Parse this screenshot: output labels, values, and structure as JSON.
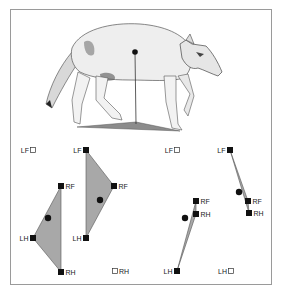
{
  "figure": {
    "illustration": {
      "center_of_mass": {
        "x": 135,
        "y": 52
      },
      "plumb_line_end": {
        "x": 136,
        "y": 124
      },
      "support_polygon": [
        [
          77,
          127
        ],
        [
          136,
          122
        ],
        [
          180,
          131
        ]
      ],
      "fill_color": "#8c8c8c"
    },
    "panels": [
      {
        "id": "panel-1",
        "labels": {
          "LF": "LF",
          "RF": "RF",
          "LH": "LH",
          "RH": "RH"
        },
        "feet": {
          "LF": {
            "x": 33,
            "y": 150,
            "contact": false,
            "label_side": "left"
          },
          "RF": {
            "x": 61,
            "y": 186,
            "contact": true,
            "label_side": "right"
          },
          "LH": {
            "x": 33,
            "y": 238,
            "contact": true,
            "label_side": "left"
          },
          "RH": {
            "x": 61,
            "y": 272,
            "contact": true,
            "label_side": "right"
          }
        },
        "polygon": [
          "RF",
          "LH",
          "RH"
        ],
        "com": {
          "x": 48,
          "y": 218
        }
      },
      {
        "id": "panel-2",
        "labels": {
          "LF": "LF",
          "RF": "RF",
          "LH": "LH",
          "RH": "RH"
        },
        "feet": {
          "LF": {
            "x": 86,
            "y": 150,
            "contact": true,
            "label_side": "left"
          },
          "RF": {
            "x": 114,
            "y": 186,
            "contact": true,
            "label_side": "right"
          },
          "LH": {
            "x": 86,
            "y": 238,
            "contact": true,
            "label_side": "left"
          },
          "RH": {
            "x": 115,
            "y": 271,
            "contact": false,
            "label_side": "right"
          }
        },
        "polygon": [
          "LF",
          "RF",
          "LH"
        ],
        "com": {
          "x": 100,
          "y": 200
        }
      },
      {
        "id": "panel-3",
        "labels": {
          "LF": "LF",
          "RF": "RF",
          "LH": "LH",
          "RH": "RH"
        },
        "feet": {
          "LF": {
            "x": 177,
            "y": 150,
            "contact": false,
            "label_side": "left"
          },
          "RF": {
            "x": 196,
            "y": 201,
            "contact": true,
            "label_side": "right"
          },
          "RH": {
            "x": 196,
            "y": 214,
            "contact": true,
            "label_side": "right"
          },
          "LH": {
            "x": 177,
            "y": 271,
            "contact": true,
            "label_side": "left"
          }
        },
        "polygon": [
          "RF",
          "RH",
          "LH"
        ],
        "com": {
          "x": 185,
          "y": 218
        }
      },
      {
        "id": "panel-4",
        "labels": {
          "LF": "LF",
          "RF": "RF",
          "LH": "LH",
          "RH": "RH"
        },
        "feet": {
          "LF": {
            "x": 230,
            "y": 150,
            "contact": true,
            "label_side": "left"
          },
          "RF": {
            "x": 248,
            "y": 201,
            "contact": true,
            "label_side": "right"
          },
          "RH": {
            "x": 249,
            "y": 213,
            "contact": true,
            "label_side": "right"
          },
          "LH": {
            "x": 231,
            "y": 271,
            "contact": false,
            "label_side": "left"
          }
        },
        "polygon": [
          "LF",
          "RF",
          "RH"
        ],
        "com": {
          "x": 239,
          "y": 192
        }
      }
    ],
    "colors": {
      "polygon_fill": "#a8a8a8",
      "polygon_stroke": "#555555",
      "foot_fill": "#111111",
      "open_foot_stroke": "#333333",
      "frame": "#9a9a9a"
    }
  }
}
